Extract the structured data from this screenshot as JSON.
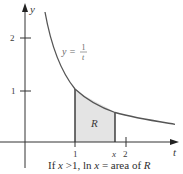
{
  "figure": {
    "axes": {
      "x_label": "t",
      "y_label": "y",
      "x_ticks": [
        {
          "value": 1,
          "label": "1"
        },
        {
          "value": 2,
          "label": "2"
        }
      ],
      "y_ticks": [
        {
          "value": 1,
          "label": "1"
        },
        {
          "value": 2,
          "label": "2"
        }
      ],
      "x_marker_label": "x"
    },
    "curve": {
      "label_lhs": "y =",
      "label_num": "1",
      "label_den": "t",
      "equation": "y = 1/t"
    },
    "region": {
      "label": "R",
      "from": 1,
      "to": 1.8,
      "fill_color": "#e4e4e4"
    },
    "caption": {
      "prefix": "If ",
      "x1": "x",
      "cond": " >1, ln ",
      "x2": "x",
      "eq": " = area of ",
      "r": "R"
    },
    "colors": {
      "curve": "#555555",
      "axis": "#333333",
      "region_edge": "#333333"
    }
  }
}
